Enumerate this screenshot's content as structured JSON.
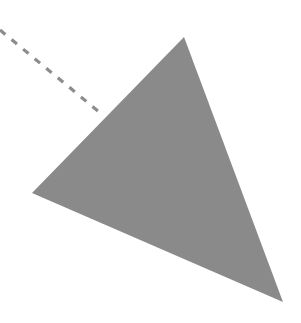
{
  "diagram": {
    "background": "#ffffff",
    "shapes": [
      {
        "type": "triangle",
        "fill": "#8a8a8a",
        "points": [
          [
            184,
            37
          ],
          [
            283,
            302
          ],
          [
            32,
            193
          ]
        ]
      },
      {
        "type": "dashed-line",
        "stroke": "#8c8c8c",
        "from": [
          0,
          30
        ],
        "to": [
          104,
          116
        ],
        "dash": "7,8",
        "width": 3.2
      }
    ]
  }
}
